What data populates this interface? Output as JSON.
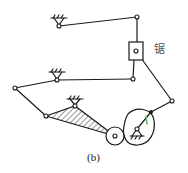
{
  "diagram": {
    "caption": "(b)",
    "saw_label": "锯",
    "colors": {
      "line": "#1a1a1a",
      "accent_green": "#6db36d",
      "background": "#ffffff"
    },
    "joints": {
      "top_ground": [
        59,
        26
      ],
      "top_right": [
        137,
        17
      ],
      "slider_pin": [
        136,
        51
      ],
      "slider_bottom": [
        133,
        79
      ],
      "mid_ground": [
        57,
        80
      ],
      "left": [
        15,
        88
      ],
      "tri_left": [
        46,
        116
      ],
      "tri_top": [
        75,
        106
      ],
      "small_gear_center": [
        115,
        136
      ],
      "cam_pivot": [
        137,
        129
      ],
      "crank_end": [
        151,
        112
      ],
      "right": [
        172,
        101
      ]
    },
    "components": [
      "ground-pivot-top",
      "ground-pivot-middle",
      "ground-pivot-triangle",
      "ground-pivot-cam",
      "slider-block",
      "hatched-triangle-link",
      "small-gear",
      "cam"
    ]
  }
}
